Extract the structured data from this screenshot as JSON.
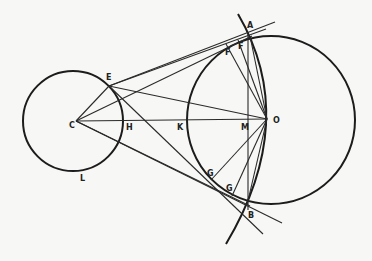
{
  "figure": {
    "type": "geometry-diagram",
    "colors": {
      "ink": "#1c1c1c",
      "paper": "#f7f7f5"
    },
    "circles": [
      {
        "name": "small-circle",
        "cx": 73,
        "cy": 121,
        "r": 50
      },
      {
        "name": "large-circle",
        "cx": 271,
        "cy": 120,
        "r": 84
      }
    ],
    "labels": {
      "A": "A",
      "B": "B",
      "C": "C",
      "E": "E",
      "F1": "F",
      "F2": "F",
      "G1": "G",
      "G2": "G",
      "H": "H",
      "K": "K",
      "L": "L",
      "M": "M",
      "O": "O"
    }
  }
}
